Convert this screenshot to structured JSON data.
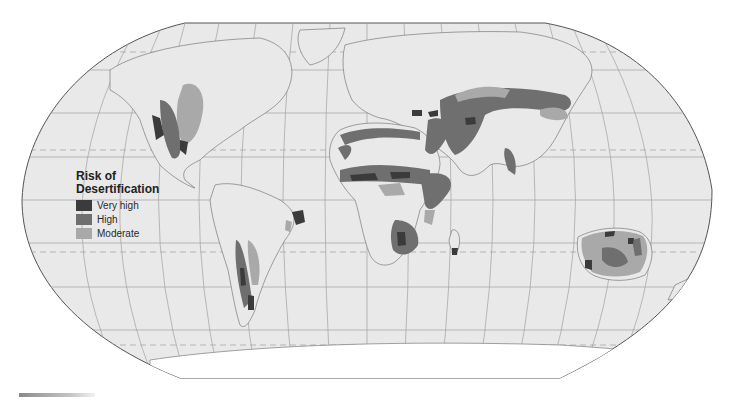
{
  "map": {
    "projection": "Robinson",
    "background_color": "#e9e9e9",
    "border_color": "#555555",
    "graticule_color": "#9a9a9a"
  },
  "legend": {
    "title_line1": "Risk of",
    "title_line2": "Desertification",
    "items": [
      {
        "label": "Very high",
        "color": "#3b3b3b"
      },
      {
        "label": "High",
        "color": "#6f6f6f"
      },
      {
        "label": "Moderate",
        "color": "#a9a9a9"
      }
    ]
  },
  "regions": [
    {
      "name": "Western North America",
      "levels": [
        "Very high",
        "High",
        "Moderate"
      ]
    },
    {
      "name": "Northeast Brazil",
      "levels": [
        "Very high",
        "Moderate"
      ]
    },
    {
      "name": "Andes / Patagonia",
      "levels": [
        "Very high",
        "High",
        "Moderate"
      ]
    },
    {
      "name": "North Africa / Sahel",
      "levels": [
        "Very high",
        "High",
        "Moderate"
      ]
    },
    {
      "name": "Horn of Africa",
      "levels": [
        "High",
        "Moderate"
      ]
    },
    {
      "name": "Southern Africa",
      "levels": [
        "Very high",
        "High",
        "Moderate"
      ]
    },
    {
      "name": "Middle East / Central Asia",
      "levels": [
        "Very high",
        "High",
        "Moderate"
      ]
    },
    {
      "name": "Northern China / Mongolia",
      "levels": [
        "High",
        "Moderate"
      ]
    },
    {
      "name": "India (Thar)",
      "levels": [
        "High",
        "Moderate"
      ]
    },
    {
      "name": "Australia",
      "levels": [
        "Very high",
        "High",
        "Moderate"
      ]
    }
  ]
}
